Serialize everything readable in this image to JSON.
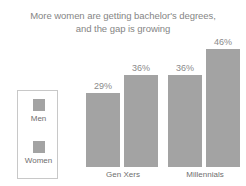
{
  "chart_data": {
    "type": "bar",
    "title": "More women are getting bachelor's degrees, and the gap is growing",
    "title_lines": [
      "More women are getting bachelor's degrees,",
      "and the gap is growing"
    ],
    "xlabel": "",
    "ylabel": "",
    "ylim": [
      0,
      52
    ],
    "grid": false,
    "legend_position": "left",
    "categories": [
      "Gen Xers",
      "Millennials"
    ],
    "series": [
      {
        "name": "Men",
        "color": "#a3a3a3",
        "values": [
          29,
          36
        ],
        "labels": [
          "29%",
          "36%"
        ]
      },
      {
        "name": "Women",
        "color": "#a3a3a3",
        "values": [
          36,
          46
        ],
        "labels": [
          "36%",
          "46%"
        ]
      }
    ]
  },
  "legend": {
    "entries": [
      {
        "label": "Men",
        "color": "#a3a3a3"
      },
      {
        "label": "Women",
        "color": "#a3a3a3"
      }
    ]
  },
  "colors": {
    "background": "#ffffff",
    "bar": "#a3a3a3",
    "title_text": "#858585",
    "label_text": "#6e6e6e",
    "value_text": "#8a8a8a",
    "legend_border": "#c8c8c8"
  }
}
